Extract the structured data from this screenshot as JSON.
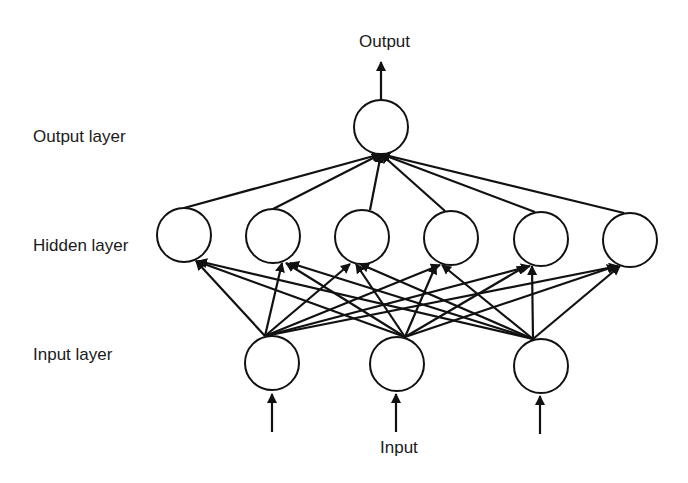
{
  "diagram": {
    "labels": {
      "output_top": "Output",
      "input_bottom": "Input",
      "output_layer": "Output layer",
      "hidden_layer": "Hidden layer",
      "input_layer": "Input layer"
    },
    "layers": {
      "input": {
        "name": "Input layer",
        "node_count": 3
      },
      "hidden": {
        "name": "Hidden layer",
        "node_count": 6
      },
      "output": {
        "name": "Output layer",
        "node_count": 1
      }
    },
    "connections": "fully connected input→hidden and hidden→output",
    "colors": {
      "stroke": "#111111",
      "background": "#ffffff",
      "text": "#1a1a1a"
    }
  }
}
